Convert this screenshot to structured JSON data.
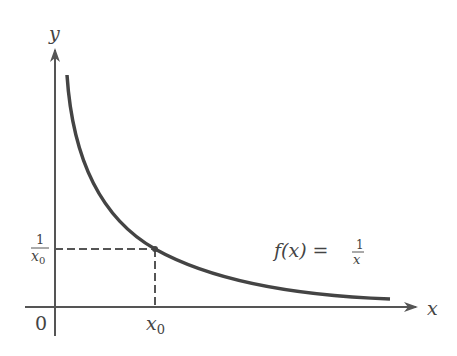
{
  "diagram": {
    "title": "",
    "type": "function-graph",
    "function_label": {
      "lhs": "f(x) =",
      "num": "1",
      "den": "x"
    },
    "axes": {
      "x_label": "x",
      "y_label": "y",
      "origin_label": "0"
    },
    "marked_point": {
      "x_tick_label": "x",
      "x_tick_sub": "0",
      "y_tick_num": "1",
      "y_tick_den": "x",
      "y_tick_den_sub": "0"
    },
    "colors": {
      "axis": "#555555",
      "curve": "#444444",
      "dashed": "#555555",
      "text": "#444444"
    }
  }
}
